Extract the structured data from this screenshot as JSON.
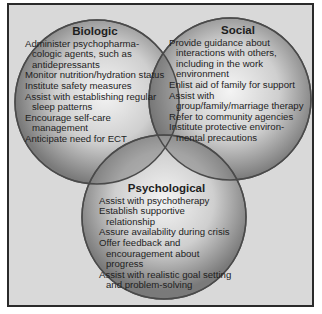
{
  "diagram": {
    "type": "venn",
    "colors": {
      "background": "#d9d9d9",
      "border": "#2a2a2a",
      "circle_light": "#f4f4f4",
      "circle_dark": "#7a7a7a",
      "circle_outline": "#5a5a5a"
    },
    "circles": [
      {
        "id": "biologic",
        "title": "Biologic",
        "items": [
          "Administer psychopharma-cologic agents, such as antidepressants",
          "Monitor nutrition/hydration status",
          "Institute safety measures",
          "Assist with establishing regular sleep patterns",
          "Encourage self-care management",
          "Anticipate need for ECT"
        ]
      },
      {
        "id": "social",
        "title": "Social",
        "items": [
          "Provide guidance about interactions with others, including in the work environment",
          "Enlist aid of family for support",
          "Assist with group/family/marriage therapy",
          "Refer to community agencies",
          "Institute protective environ-mental precautions"
        ]
      },
      {
        "id": "psychological",
        "title": "Psychological",
        "items": [
          "Assist with psychotherapy",
          "Establish supportive relationship",
          "Assure availability during crisis",
          "Offer feedback and encouragement about progress",
          "Assist with realistic goal setting and problem-solving"
        ]
      }
    ]
  }
}
